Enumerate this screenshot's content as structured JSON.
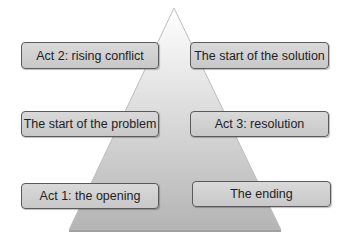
{
  "diagram": {
    "shape": "triangle",
    "title": "",
    "boxes": {
      "left_top": "Act 2: rising conflict",
      "left_middle": "The start of the problem",
      "left_bottom": "Act 1: the opening",
      "right_top": "The start of the solution",
      "right_middle": "Act 3: resolution",
      "right_bottom": "The ending"
    }
  },
  "colors": {
    "triangle_top": "#ffffff",
    "triangle_bottom": "#b8b8b8",
    "box_fill": "#d0d0d0",
    "box_border": "#5a5a5a"
  }
}
